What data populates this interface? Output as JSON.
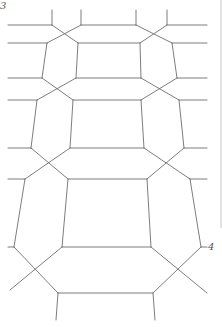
{
  "figure": {
    "type": "tessellation-mesh",
    "stroke_color": "#6e6e6e",
    "edge_color": "#c8c8c8",
    "labels": [
      {
        "text": "3",
        "x": 0,
        "y": 8
      },
      {
        "text": "4",
        "x": 208,
        "y": 251
      }
    ],
    "segments": [
      [
        52,
        10,
        52,
        25
      ],
      [
        81,
        10,
        81,
        25
      ],
      [
        136,
        10,
        136,
        25
      ],
      [
        167,
        10,
        167,
        25
      ],
      [
        8,
        25,
        52,
        25
      ],
      [
        81,
        25,
        136,
        25
      ],
      [
        167,
        25,
        207,
        25
      ],
      [
        52,
        25,
        78,
        43
      ],
      [
        81,
        25,
        47,
        43
      ],
      [
        136,
        25,
        172,
        43
      ],
      [
        167,
        25,
        140,
        43
      ],
      [
        8,
        43,
        47,
        43
      ],
      [
        78,
        43,
        140,
        43
      ],
      [
        172,
        43,
        207,
        43
      ],
      [
        47,
        43,
        42,
        78
      ],
      [
        78,
        43,
        76,
        78
      ],
      [
        140,
        43,
        141,
        78
      ],
      [
        172,
        43,
        177,
        78
      ],
      [
        8,
        78,
        42,
        78
      ],
      [
        76,
        78,
        141,
        78
      ],
      [
        177,
        78,
        207,
        78
      ],
      [
        42,
        78,
        73,
        100
      ],
      [
        76,
        78,
        37,
        100
      ],
      [
        141,
        78,
        179,
        100
      ],
      [
        177,
        78,
        141,
        100
      ],
      [
        8,
        100,
        37,
        100
      ],
      [
        73,
        100,
        141,
        100
      ],
      [
        179,
        100,
        207,
        100
      ],
      [
        37,
        100,
        31,
        148
      ],
      [
        73,
        100,
        70,
        148
      ],
      [
        141,
        100,
        144,
        148
      ],
      [
        179,
        100,
        184,
        148
      ],
      [
        8,
        148,
        31,
        148
      ],
      [
        70,
        148,
        144,
        148
      ],
      [
        184,
        148,
        207,
        148
      ],
      [
        31,
        148,
        68,
        179
      ],
      [
        70,
        148,
        25,
        179
      ],
      [
        144,
        148,
        190,
        179
      ],
      [
        184,
        148,
        147,
        179
      ],
      [
        8,
        179,
        25,
        179
      ],
      [
        68,
        179,
        147,
        179
      ],
      [
        190,
        179,
        207,
        179
      ],
      [
        25,
        179,
        14,
        247
      ],
      [
        68,
        179,
        62,
        247
      ],
      [
        147,
        179,
        151,
        247
      ],
      [
        190,
        179,
        201,
        247
      ],
      [
        8,
        247,
        14,
        247
      ],
      [
        62,
        247,
        151,
        247
      ],
      [
        201,
        247,
        207,
        247
      ],
      [
        14,
        247,
        58,
        293
      ],
      [
        62,
        247,
        10,
        290
      ],
      [
        151,
        247,
        207,
        293
      ],
      [
        201,
        247,
        153,
        293
      ],
      [
        58,
        293,
        153,
        293
      ],
      [
        58,
        293,
        56,
        320
      ],
      [
        153,
        293,
        155,
        320
      ]
    ]
  }
}
